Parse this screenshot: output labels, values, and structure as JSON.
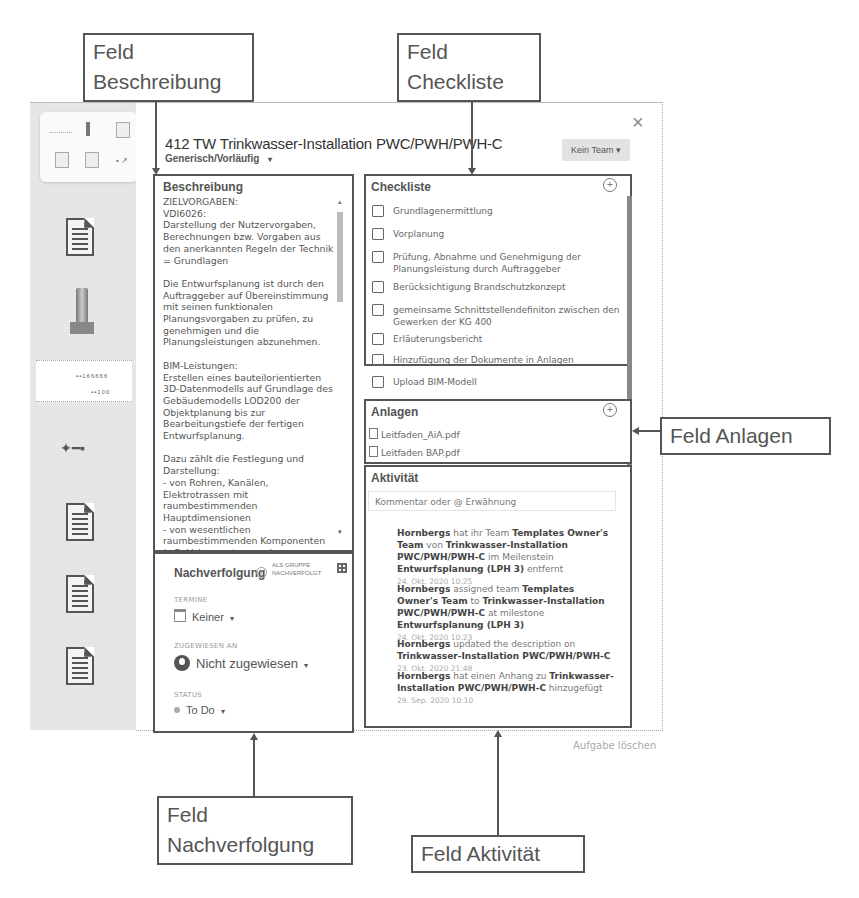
{
  "callouts": {
    "beschreibung": [
      "Feld",
      "Beschreibung"
    ],
    "checkliste": [
      "Feld",
      "Checkliste"
    ],
    "anlagen": "Feld Anlagen",
    "nachverfolgung": [
      "Feld",
      "Nachverfolgung"
    ],
    "aktivitaet": "Feld Aktivität"
  },
  "header": {
    "title": "412 TW Trinkwasser-Installation PWC/PWH/PWH-C",
    "subtitle": "Generisch/Vorläufig",
    "subtitle_caret": "▾",
    "team_button": "Kein Team ▾",
    "close_icon": "×"
  },
  "beschreibung": {
    "title": "Beschreibung",
    "text": "ZIELVORGABEN:\nVDI6026:\nDarstellung der Nutzervorgaben, Berechnungen bzw. Vorgaben aus den anerkannten Regeln der Technik = Grundlagen\n\nDie Entwurfsplanung ist durch den Auftraggeber auf Übereinstimmung mit seinen funktionalen Planungsvorgaben zu prüfen, zu genehmigen und die Planungsleistungen abzunehmen.\n\nBIM-Leistungen:\nErstellen eines bauteilorientierten  3D-Datenmodells auf Grundlage des Gebäudemodells LOD200 der Objektplanung bis zur Bearbeitungstiefe der fertigen Entwurfsplanung.\n\nDazu zählt die Festlegung und Darstellung:\n- von Rohren, Kanälen, Elektrotrassen mit raumbestimmenden Hauptdimensionen\n- von wesentlichen raumbestimmenden Komponenten  (z.B. Volumenstromregler, Zentralgeräte) mit",
    "scroll_up": "▴",
    "scroll_down": "▾"
  },
  "nachverfolgung": {
    "title": "Nachverfolgung",
    "info_icon": "i",
    "group_label_1": "ALS GRUPPE",
    "group_label_2": "NACHVERFOLGT",
    "termine_label": "TERMINE",
    "termine_value": "Keiner",
    "assigned_label": "ZUGEWIESEN AN",
    "assigned_value": "Nicht zugewiesen",
    "status_label": "STATUS",
    "status_value": "To Do",
    "caret": "▾"
  },
  "checkliste": {
    "title": "Checkliste",
    "add_icon": "+",
    "items": [
      {
        "label": "Grundlagenermittlung",
        "checked": false
      },
      {
        "label": "Vorplanung",
        "checked": false
      },
      {
        "label": "Prüfung, Abnahme und Genehmigung der Planungsleistung durch Auftraggeber",
        "checked": false
      },
      {
        "label": "Berücksichtigung Brandschutzkonzept",
        "checked": false
      },
      {
        "label": "gemeinsame Schnittstellendefiniton zwischen den Gewerken der KG 400",
        "checked": false
      },
      {
        "label": "Erläuterungsbericht",
        "checked": false
      },
      {
        "label": "Hinzufügung der Dokumente in Anlagen",
        "checked": false
      },
      {
        "label": "Upload BIM-Modell",
        "checked": false
      }
    ]
  },
  "anlagen": {
    "title": "Anlagen",
    "add_icon": "+",
    "files": [
      "Leitfaden_AiA.pdf",
      "Leitfaden BAP.pdf"
    ]
  },
  "aktivitaet": {
    "title": "Aktivität",
    "comment_placeholder": "Kommentar oder @ Erwähnung",
    "entries": [
      {
        "parts": [
          {
            "t": "Hornbergs",
            "b": true
          },
          {
            "t": " hat ihr Team ",
            "b": false
          },
          {
            "t": "Templates Owner's Team",
            "b": true
          },
          {
            "t": " von ",
            "b": false
          },
          {
            "t": "Trinkwasser-Installation PWC/PWH/PWH-C",
            "b": true
          },
          {
            "t": " im Meilenstein ",
            "b": false
          },
          {
            "t": "Entwurfsplanung (LPH 3)",
            "b": true
          },
          {
            "t": " entfernt",
            "b": false
          }
        ],
        "time": "24. Okt. 2020 10:25"
      },
      {
        "parts": [
          {
            "t": "Hornbergs",
            "b": true
          },
          {
            "t": " assigned team ",
            "b": false
          },
          {
            "t": "Templates Owner's Team",
            "b": true
          },
          {
            "t": " to ",
            "b": false
          },
          {
            "t": "Trinkwasser-Installation PWC/PWH/PWH-C",
            "b": true
          },
          {
            "t": " at milestone ",
            "b": false
          },
          {
            "t": "Entwurfsplanung (LPH 3)",
            "b": true
          }
        ],
        "time": "24. Okt. 2020 10:23"
      },
      {
        "parts": [
          {
            "t": "Hornbergs",
            "b": true
          },
          {
            "t": " updated the description on ",
            "b": false
          },
          {
            "t": "Trinkwasser-Installation PWC/PWH/PWH-C",
            "b": true
          }
        ],
        "time": "23. Okt. 2020 21:48"
      },
      {
        "parts": [
          {
            "t": "Hornbergs",
            "b": true
          },
          {
            "t": " hat einen Anhang zu ",
            "b": false
          },
          {
            "t": "Trinkwasser-Installation PWC/PWH/PWH-C",
            "b": true
          },
          {
            "t": " hinzugefügt",
            "b": false
          }
        ],
        "time": "29. Sep. 2020 10:10"
      }
    ]
  },
  "footer": {
    "delete_task": "Aufgabe löschen"
  },
  "rail": {
    "item_labels": [
      "document",
      "valve",
      "drawing",
      "fitting",
      "document",
      "document",
      "document"
    ]
  }
}
